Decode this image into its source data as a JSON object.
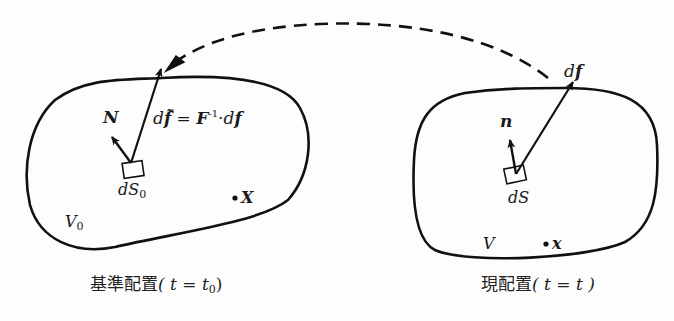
{
  "diagram": {
    "reference": {
      "caption_prefix": "基準配置",
      "caption_math": "( t = t",
      "caption_sub": "0",
      "caption_close": ")",
      "volume_label": "V",
      "volume_sub": "0",
      "normal_label": "N",
      "area_label": "dS",
      "area_sub": "0",
      "point_label": "X",
      "force_eq_d": "d",
      "force_eq_f": "f̃",
      "force_eq_eq": " = ",
      "force_eq_F": "F",
      "force_eq_sup": "-1",
      "force_eq_dot": "·",
      "force_eq_df_d": "d",
      "force_eq_df_f": "f"
    },
    "current": {
      "caption_prefix": "現配置",
      "caption_math": "( t = t )",
      "volume_label": "V",
      "normal_label": "n",
      "area_label": "dS",
      "point_label": "x",
      "force_d": "d",
      "force_f": "f"
    },
    "mapping": {
      "style": "dashed",
      "direction": "current-to-reference"
    },
    "colors": {
      "stroke": "#111111",
      "text": "#1a1a1a",
      "background": "#fdfdfd"
    }
  }
}
